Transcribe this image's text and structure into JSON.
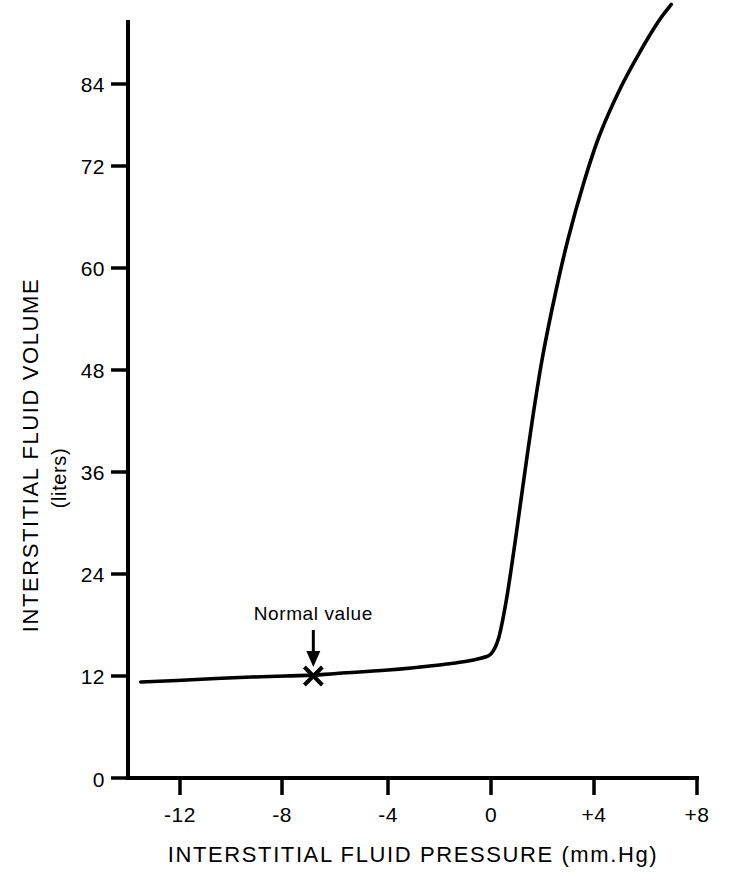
{
  "chart_data": {
    "type": "line",
    "title": "",
    "xlabel": "INTERSTITIAL FLUID PRESSURE  (mm.Hg)",
    "ylabel": "INTERSTITIAL FLUID VOLUME",
    "ylabel_units": "(liters)",
    "xlim": [
      -13.6,
      8.0
    ],
    "ylim": [
      0,
      92
    ],
    "grid": false,
    "legend": null,
    "xticks": [
      -12,
      -8,
      -4,
      0,
      4,
      8
    ],
    "xtick_labels": [
      "-12",
      "-8",
      "-4",
      "0",
      "+4",
      "+8"
    ],
    "yticks": [
      0,
      12,
      24,
      36,
      48,
      60,
      72,
      84
    ],
    "ytick_labels": [
      "0",
      "12",
      "24",
      "36",
      "48",
      "60",
      "72",
      "84"
    ],
    "series": [
      {
        "name": "interstitial fluid volume",
        "x": [
          -13.6,
          -12,
          -10,
          -8,
          -6.9,
          -6,
          -4,
          -2,
          -1,
          -0.4,
          0,
          0.3,
          0.6,
          0.9,
          1.2,
          1.6,
          2.0,
          2.5,
          3.0,
          3.6,
          4.2,
          5.0,
          5.8,
          6.5,
          7.0
        ],
        "y": [
          11.3,
          11.5,
          11.8,
          12.0,
          12.1,
          12.3,
          12.7,
          13.3,
          13.7,
          14.1,
          14.6,
          16.5,
          21.0,
          27.0,
          33.5,
          42.0,
          49.5,
          57.0,
          63.5,
          70.0,
          75.5,
          81.0,
          85.5,
          89.0,
          91.0
        ]
      }
    ],
    "annotations": [
      {
        "name": "normal-value",
        "label": "Normal  value",
        "marker": "x",
        "x": -6.9,
        "y": 12.0,
        "arrow": "down"
      }
    ],
    "colors": {
      "curve": "#000000",
      "axis": "#000000",
      "background": "#ffffff",
      "text": "#000000"
    }
  }
}
